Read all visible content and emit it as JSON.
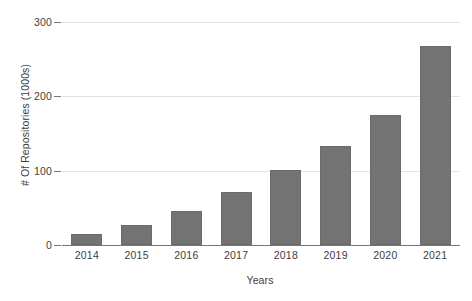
{
  "chart_data": {
    "type": "bar",
    "title": "",
    "xlabel": "Years",
    "ylabel": "# Of Repositories (1000s)",
    "categories": [
      "2014",
      "2015",
      "2016",
      "2017",
      "2018",
      "2019",
      "2020",
      "2021"
    ],
    "values": [
      15,
      27,
      46,
      71,
      101,
      133,
      175,
      268
    ],
    "ylim": [
      0,
      300
    ],
    "yticks": [
      0,
      100,
      200,
      300
    ],
    "ytick_labels": [
      "0",
      "100",
      "200",
      "300"
    ],
    "grid": true,
    "legend": null,
    "series": [
      {
        "name": "# Of Repositories (1000s)",
        "values": [
          15,
          27,
          46,
          71,
          101,
          133,
          175,
          268
        ]
      }
    ],
    "colors": {
      "bar_fill": "#737373",
      "bar_stroke": "#6b6b6b",
      "gridline": "#e3e3e3",
      "axis_line": "#767676",
      "text": "#3d3d3d",
      "background": "#ffffff"
    }
  }
}
